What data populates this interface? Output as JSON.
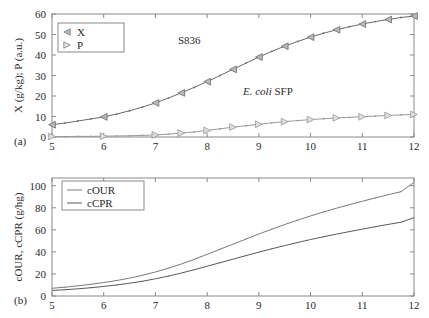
{
  "figure": {
    "panel_a_label": "(a)",
    "panel_b_label": "(b)",
    "annotation_strain": "S836",
    "annotation_organism_italic": "E. coli",
    "annotation_organism_rest": " SFP"
  },
  "colors": {
    "axis": "#8a8a8a",
    "text": "#2b2b2b",
    "series_x": "#6b6b6b",
    "series_p": "#9a9a9a",
    "series_cour": "#7a7a7a",
    "series_ccpr": "#5a5a5a",
    "background": "#ffffff"
  },
  "chart_data": [
    {
      "type": "line",
      "panel": "(a)",
      "title": "",
      "xlabel": "",
      "ylabel": "X (g/kg); P (a.u.)",
      "xlim": [
        5,
        12
      ],
      "ylim": [
        0,
        60
      ],
      "xticks": [
        5,
        6,
        7,
        8,
        9,
        10,
        11,
        12
      ],
      "yticks": [
        0,
        10,
        20,
        30,
        40,
        50,
        60
      ],
      "xticklabels": [
        "5",
        "6",
        "7",
        "8",
        "9",
        "10",
        "11",
        "12"
      ],
      "yticklabels": [
        "0",
        "10",
        "20",
        "30",
        "40",
        "50",
        "60"
      ],
      "grid": false,
      "legend_position": "top-left",
      "annotations": [
        "S836",
        "E. coli SFP"
      ],
      "x": [
        5,
        5.25,
        5.5,
        5.75,
        6,
        6.25,
        6.5,
        6.75,
        7,
        7.25,
        7.5,
        7.75,
        8,
        8.25,
        8.5,
        8.75,
        9,
        9.25,
        9.5,
        9.75,
        10,
        10.25,
        10.5,
        10.75,
        11,
        11.25,
        11.5,
        11.75,
        12
      ],
      "series": [
        {
          "name": "X",
          "marker": "left-triangle",
          "marker_x": [
            5,
            6,
            7,
            7.5,
            8,
            8.5,
            9,
            9.5,
            10,
            10.5,
            11,
            11.5,
            12
          ],
          "values": [
            6.0,
            6.8,
            7.8,
            8.8,
            9.8,
            11.2,
            12.8,
            14.6,
            16.6,
            19.0,
            21.5,
            24.2,
            27.0,
            30.0,
            33.0,
            36.0,
            39.0,
            41.8,
            44.3,
            46.6,
            48.7,
            50.6,
            52.3,
            53.8,
            55.1,
            56.3,
            57.3,
            58.3,
            59.0
          ]
        },
        {
          "name": "P",
          "marker": "right-triangle",
          "marker_x": [
            5,
            6,
            7,
            7.5,
            8,
            8.5,
            9,
            9.5,
            10,
            10.5,
            11,
            11.5,
            12
          ],
          "values": [
            0.2,
            0.2,
            0.3,
            0.3,
            0.4,
            0.5,
            0.6,
            0.8,
            1.0,
            1.4,
            1.9,
            2.5,
            3.2,
            4.0,
            4.8,
            5.5,
            6.2,
            6.9,
            7.5,
            8.0,
            8.5,
            8.9,
            9.3,
            9.6,
            9.9,
            10.2,
            10.5,
            10.8,
            11.0
          ]
        }
      ]
    },
    {
      "type": "line",
      "panel": "(b)",
      "title": "",
      "xlabel": "",
      "ylabel": "cOUR, cCPR (g/hg)",
      "xlim": [
        5,
        12
      ],
      "ylim": [
        0,
        107
      ],
      "xticks": [
        5,
        6,
        7,
        8,
        9,
        10,
        11,
        12
      ],
      "yticks": [
        0,
        20,
        40,
        60,
        80,
        100
      ],
      "xticklabels": [
        "5",
        "6",
        "7",
        "8",
        "9",
        "10",
        "11",
        "12"
      ],
      "yticklabels": [
        "0",
        "20",
        "40",
        "60",
        "80",
        "100"
      ],
      "grid": false,
      "legend_position": "top-left",
      "x": [
        5,
        5.25,
        5.5,
        5.75,
        6,
        6.25,
        6.5,
        6.75,
        7,
        7.25,
        7.5,
        7.75,
        8,
        8.25,
        8.5,
        8.75,
        9,
        9.25,
        9.5,
        9.75,
        10,
        10.25,
        10.5,
        10.75,
        11,
        11.25,
        11.5,
        11.75,
        12
      ],
      "series": [
        {
          "name": "cOUR",
          "values": [
            7.0,
            8.0,
            9.2,
            10.6,
            12.2,
            14.0,
            16.2,
            18.8,
            21.8,
            25.2,
            29.0,
            33.2,
            37.8,
            42.4,
            47.0,
            51.6,
            56.2,
            60.6,
            64.8,
            68.8,
            72.6,
            76.2,
            79.6,
            82.8,
            85.9,
            88.9,
            91.8,
            94.6,
            103.0
          ]
        },
        {
          "name": "cCPR",
          "values": [
            5.0,
            5.7,
            6.5,
            7.5,
            8.7,
            10.0,
            11.6,
            13.4,
            15.6,
            18.0,
            20.8,
            23.8,
            27.0,
            30.2,
            33.4,
            36.6,
            39.8,
            42.8,
            45.7,
            48.5,
            51.2,
            53.7,
            56.1,
            58.4,
            60.6,
            62.8,
            64.9,
            66.9,
            71.0
          ]
        }
      ]
    }
  ],
  "legend_a": {
    "entries": [
      {
        "label": "X",
        "marker": "left-triangle"
      },
      {
        "label": "P",
        "marker": "right-triangle"
      }
    ]
  },
  "legend_b": {
    "entries": [
      {
        "label": "cOUR",
        "marker": "line"
      },
      {
        "label": "cCPR",
        "marker": "line"
      }
    ]
  }
}
